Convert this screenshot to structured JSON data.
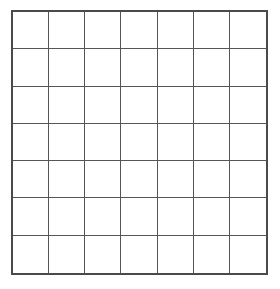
{
  "diagram": {
    "type": "empty-grid",
    "rows": 7,
    "columns": 7,
    "line_color": "#555555",
    "border_color": "#4a4a4a",
    "background": "#ffffff",
    "cells": []
  }
}
